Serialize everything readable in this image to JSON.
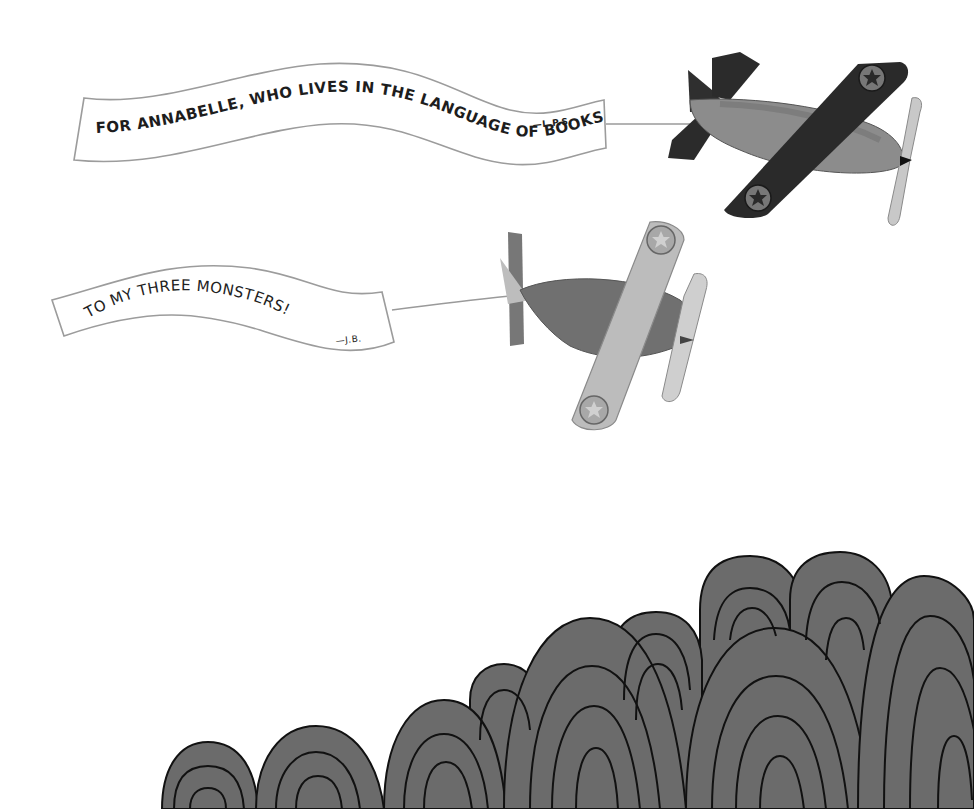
{
  "scene": {
    "description": "Picture-book dedication page: two toy airplanes towing banners over gray striped hills",
    "background_color": "#ffffff"
  },
  "banners": [
    {
      "text": "FOR ANNABELLE, WHO LIVES IN THE LANGUAGE OF BOOKS.",
      "signature": "—L.P.S.",
      "style": "bold block capitals"
    },
    {
      "text": "TO MY THREE MONSTERS!",
      "signature": "—J.B.",
      "style": "hand-lettered capitals"
    }
  ],
  "planes": [
    {
      "name": "dark monoplane",
      "wing_color": "#2e2e2e",
      "body_color": "#8a8a8a",
      "insignia": "star"
    },
    {
      "name": "light biplane",
      "wing_color": "#b8b8b8",
      "body_color": "#6f6f6f",
      "insignia": "star"
    }
  ],
  "hills": {
    "fill_color": "#6b6b6b",
    "line_color": "#111111",
    "pattern": "concentric arches"
  }
}
